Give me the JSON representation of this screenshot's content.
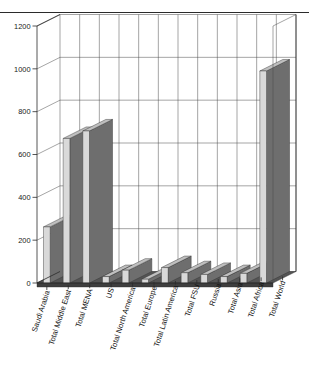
{
  "chart_data": {
    "type": "bar",
    "title": "",
    "subtitle": "",
    "xlabel": "",
    "ylabel": "",
    "ylim": [
      0,
      1200
    ],
    "ytick_step": 200,
    "yticks": [
      0,
      200,
      400,
      600,
      800,
      1000,
      1200
    ],
    "ytick_labels": [
      "0",
      "200",
      "400",
      "600",
      "800",
      "1000",
      "1200"
    ],
    "grid": true,
    "legend": false,
    "three_d": true,
    "bar_face_color": "#d9d9d9",
    "bar_side_color": "#6e6e6e",
    "categories": [
      "Saudi Arabia",
      "Total Middle East",
      "Total MENA",
      "US",
      "Total North America",
      "Total Europe",
      "Total Latin America",
      "Total FSU",
      "Russia",
      "Total Asia",
      "Total Africa",
      "Total World"
    ],
    "values": [
      262,
      675,
      710,
      30,
      60,
      18,
      72,
      48,
      40,
      30,
      45,
      990
    ]
  },
  "decorations": {
    "top_rule": "horizontal-rule"
  }
}
